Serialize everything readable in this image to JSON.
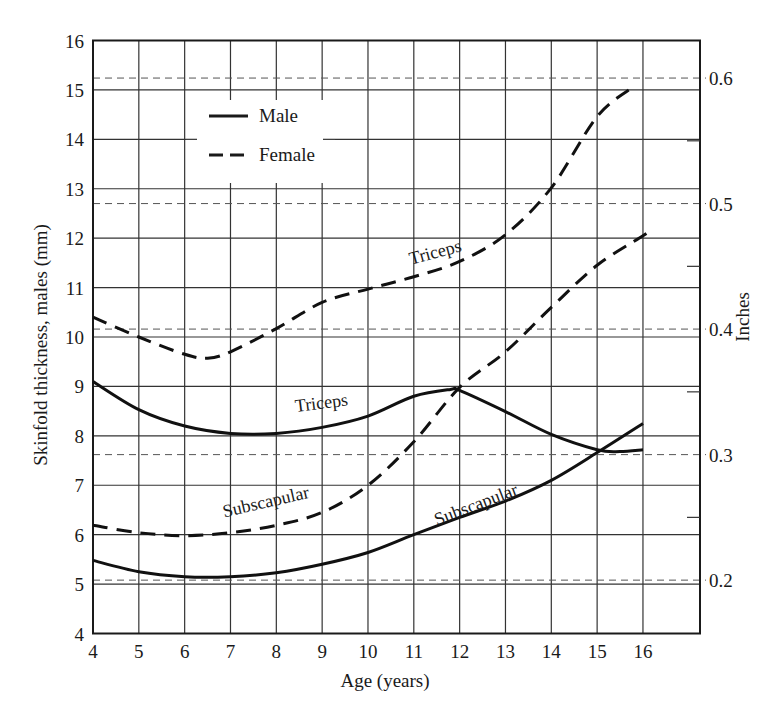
{
  "chart_data": {
    "type": "line",
    "title": "",
    "xlabel": "Age (years)",
    "ylabel": "Skinfold thickness, males (mm)",
    "ylabel_right": "Inches",
    "xlim": [
      4,
      17.24
    ],
    "ylim": [
      4,
      16
    ],
    "x_ticks": [
      4,
      5,
      6,
      7,
      8,
      9,
      10,
      11,
      12,
      13,
      14,
      15,
      16
    ],
    "y_ticks": [
      4,
      5,
      6,
      7,
      8,
      9,
      10,
      11,
      12,
      13,
      14,
      15,
      16
    ],
    "right_ticks": [
      {
        "label": "0.6",
        "mm": 15.24
      },
      {
        "label": "0.5",
        "mm": 12.7
      },
      {
        "label": "0.4",
        "mm": 10.16
      },
      {
        "label": "0.3",
        "mm": 7.62
      },
      {
        "label": "0.2",
        "mm": 5.08
      }
    ],
    "right_minor_ticks_mm": [
      13.97,
      11.43,
      8.89,
      6.35
    ],
    "grid": true,
    "legend": {
      "position": "upper left",
      "entries": [
        {
          "label": "Male",
          "style": "solid"
        },
        {
          "label": "Female",
          "style": "dashed"
        }
      ]
    },
    "series": [
      {
        "name": "Male Triceps",
        "sex": "Male",
        "site": "Triceps",
        "style": "solid",
        "x": [
          4,
          5,
          6,
          7,
          8,
          9,
          10,
          11,
          11.8,
          12,
          13,
          14,
          15,
          15.5,
          16
        ],
        "y": [
          9.1,
          8.53,
          8.2,
          8.05,
          8.05,
          8.17,
          8.4,
          8.8,
          8.94,
          8.92,
          8.49,
          8.03,
          7.72,
          7.68,
          7.72
        ]
      },
      {
        "name": "Male Subscapular",
        "sex": "Male",
        "site": "Subscapular",
        "style": "solid",
        "x": [
          4,
          5,
          6,
          7,
          8,
          9,
          10,
          11,
          12,
          13,
          14,
          15,
          16
        ],
        "y": [
          5.48,
          5.25,
          5.15,
          5.15,
          5.23,
          5.4,
          5.64,
          6.0,
          6.35,
          6.68,
          7.1,
          7.66,
          8.25
        ]
      },
      {
        "name": "Female Triceps",
        "sex": "Female",
        "site": "Triceps",
        "style": "dashed",
        "x": [
          4,
          5,
          6,
          6.5,
          7,
          8,
          9,
          10,
          11,
          12,
          13,
          14,
          15,
          15.8
        ],
        "y": [
          10.4,
          10.0,
          9.65,
          9.57,
          9.7,
          10.17,
          10.7,
          10.97,
          11.22,
          11.53,
          12.07,
          13.02,
          14.46,
          15.07
        ]
      },
      {
        "name": "Female Subscapular",
        "sex": "Female",
        "site": "Subscapular",
        "style": "dashed",
        "x": [
          4,
          5,
          6,
          7,
          8,
          9,
          10,
          11,
          12,
          13,
          14,
          15,
          16,
          16.15
        ],
        "y": [
          6.19,
          6.04,
          5.98,
          6.04,
          6.19,
          6.45,
          7.0,
          7.88,
          8.98,
          9.7,
          10.6,
          11.45,
          12.05,
          12.15
        ]
      }
    ],
    "annotations": [
      {
        "text": "Triceps",
        "series": "Female Triceps",
        "x": 11.5,
        "y": 11.6,
        "angle": -15
      },
      {
        "text": "Triceps",
        "series": "Male Triceps",
        "x": 9.0,
        "y": 8.55,
        "angle": -7
      },
      {
        "text": "Subscapular",
        "series": "Female Subscapular",
        "x": 7.8,
        "y": 6.55,
        "angle": -13
      },
      {
        "text": "Subscapular",
        "series": "Male Subscapular",
        "x": 12.4,
        "y": 6.5,
        "angle": -21
      }
    ]
  }
}
